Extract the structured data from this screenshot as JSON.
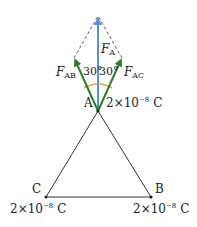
{
  "diagram": {
    "points": {
      "A": {
        "label": "A",
        "charge": "2×10",
        "exp": "−8",
        "unit": "C"
      },
      "B": {
        "label": "B",
        "charge": "2×10",
        "exp": "−8",
        "unit": "C"
      },
      "C": {
        "label": "C",
        "charge": "2×10",
        "exp": "−8",
        "unit": "C"
      }
    },
    "forces": {
      "FA": {
        "symbol": "F",
        "sub": "A",
        "color": "#5b8fd6"
      },
      "FAB": {
        "symbol": "F",
        "sub": "AB",
        "color": "#2f7a2a"
      },
      "FAC": {
        "symbol": "F",
        "sub": "AC",
        "color": "#2f7a2a"
      }
    },
    "angles": {
      "left": "30°",
      "right": "30°",
      "arc_color": "#f0a050"
    }
  }
}
